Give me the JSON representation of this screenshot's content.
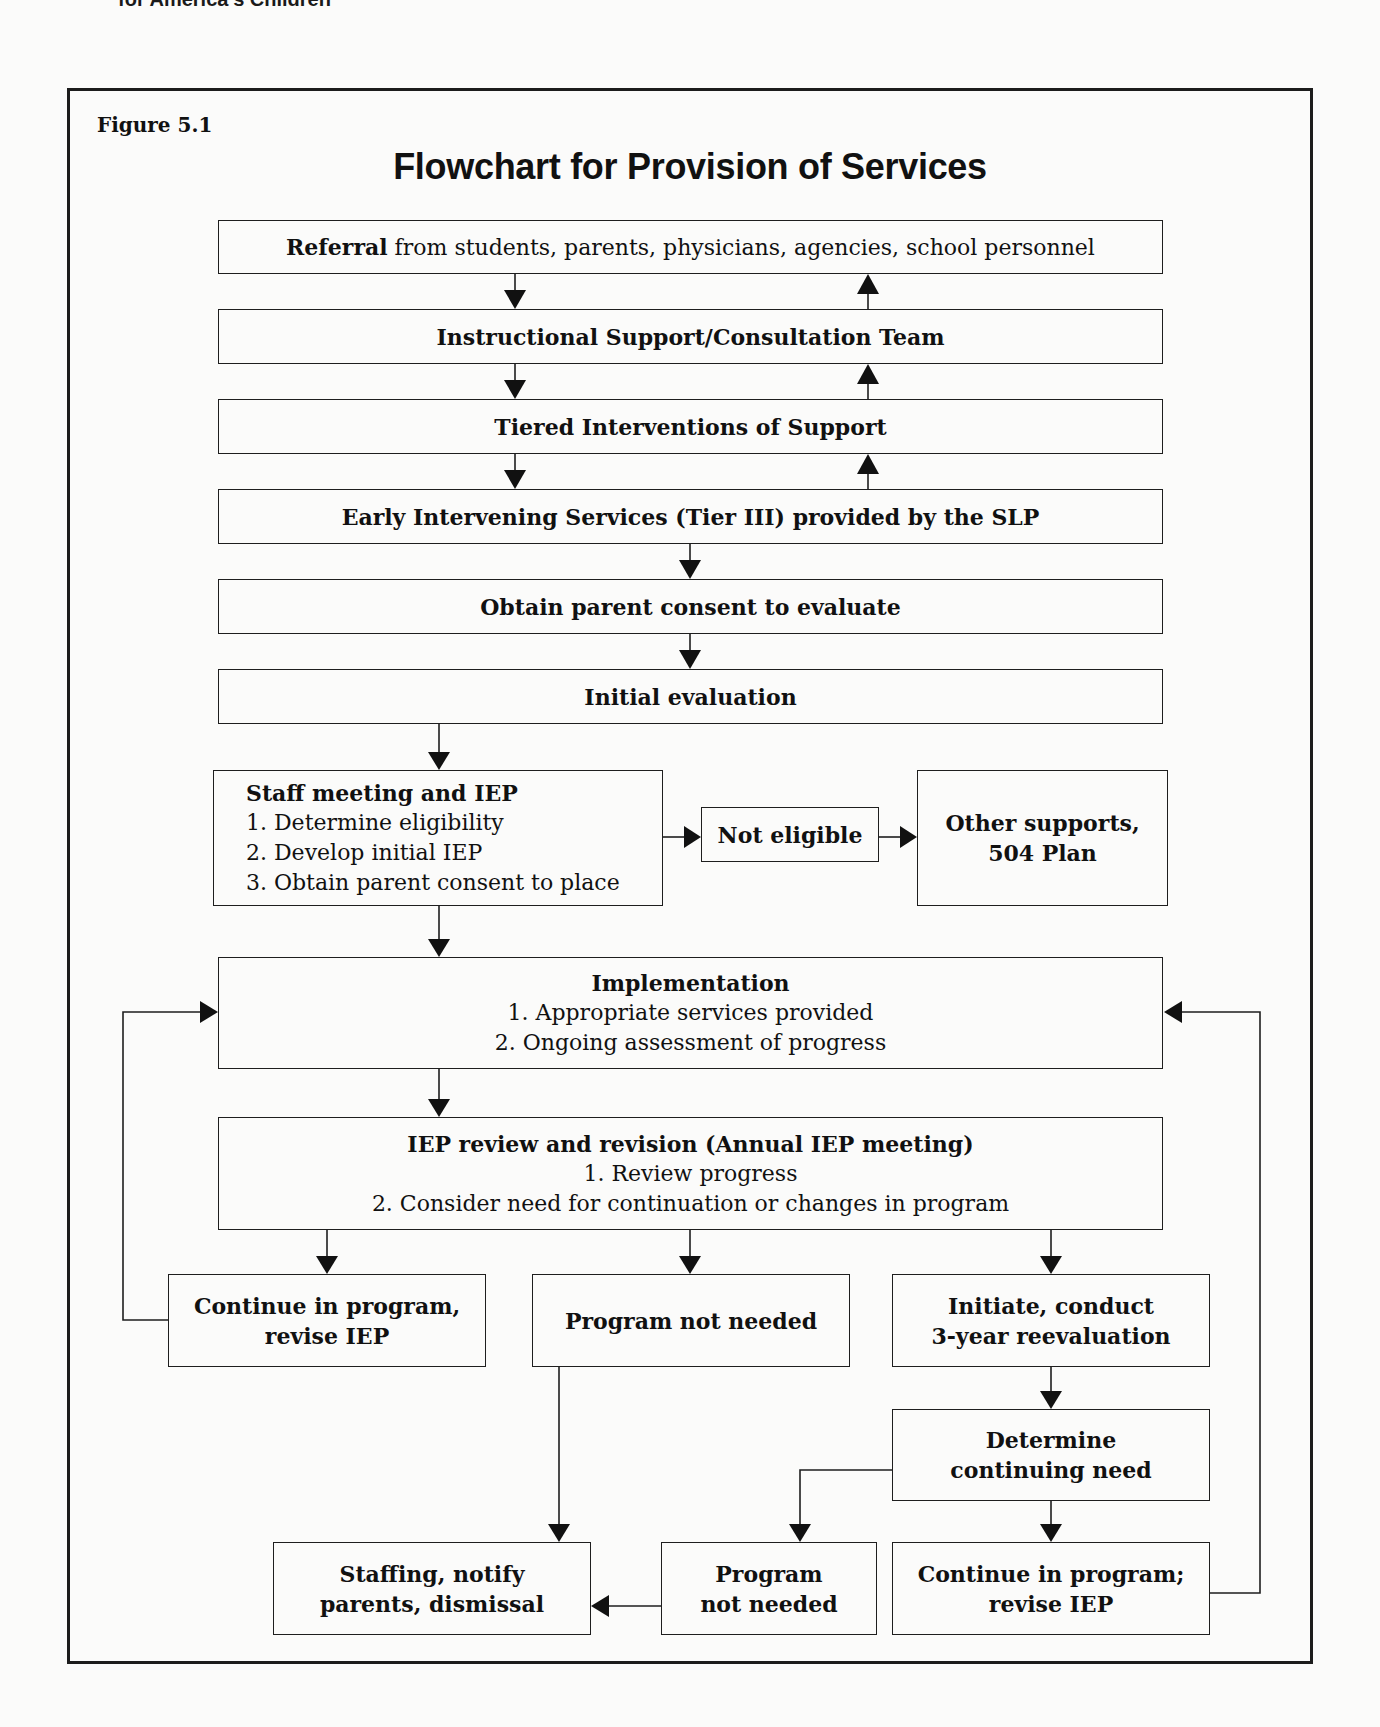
{
  "page": {
    "running_head": "for America's Children",
    "figure_label": "Figure 5.1",
    "title": "Flowchart for Provision of Services"
  },
  "nodes": {
    "referral": {
      "bold": "Referral",
      "text": " from students, parents, physicians, agencies, school personnel"
    },
    "instructional_support": {
      "title": "Instructional Support/Consultation Team"
    },
    "tiered_interventions": {
      "title": "Tiered Interventions of Support"
    },
    "early_intervening": {
      "title": "Early Intervening Services (Tier III) provided by the SLP"
    },
    "parent_consent": {
      "title": "Obtain parent consent to evaluate"
    },
    "initial_evaluation": {
      "title": "Initial evaluation"
    },
    "staff_meeting": {
      "title": "Staff meeting and IEP",
      "items": [
        "1. Determine eligibility",
        "2. Develop initial IEP",
        "3. Obtain parent consent to place"
      ]
    },
    "not_eligible": {
      "title": "Not eligible"
    },
    "other_supports": {
      "line1": "Other supports,",
      "line2": "504 Plan"
    },
    "implementation": {
      "title": "Implementation",
      "items": [
        "1. Appropriate services provided",
        "2. Ongoing assessment of progress"
      ]
    },
    "iep_review": {
      "title": "IEP review and revision (Annual IEP meeting)",
      "items": [
        "1. Review progress",
        "2. Consider need for continuation or changes in program"
      ]
    },
    "continue_revise": {
      "line1": "Continue in program,",
      "line2": "revise IEP"
    },
    "program_not_needed_1": {
      "title": "Program not needed"
    },
    "reevaluation": {
      "line1": "Initiate, conduct",
      "line2": "3-year reevaluation"
    },
    "determine_need": {
      "line1": "Determine",
      "line2": "continuing need"
    },
    "staffing_dismissal": {
      "line1": "Staffing, notify",
      "line2": "parents, dismissal"
    },
    "program_not_needed_2": {
      "line1": "Program",
      "line2": "not needed"
    },
    "continue_revise_2": {
      "line1": "Continue in program;",
      "line2": "revise IEP"
    }
  },
  "edges": [
    {
      "from": "referral",
      "to": "instructional_support",
      "direction": "down"
    },
    {
      "from": "instructional_support",
      "to": "referral",
      "direction": "up"
    },
    {
      "from": "instructional_support",
      "to": "tiered_interventions",
      "direction": "down"
    },
    {
      "from": "tiered_interventions",
      "to": "instructional_support",
      "direction": "up"
    },
    {
      "from": "tiered_interventions",
      "to": "early_intervening",
      "direction": "down"
    },
    {
      "from": "early_intervening",
      "to": "tiered_interventions",
      "direction": "up"
    },
    {
      "from": "early_intervening",
      "to": "parent_consent",
      "direction": "down"
    },
    {
      "from": "parent_consent",
      "to": "initial_evaluation",
      "direction": "down"
    },
    {
      "from": "initial_evaluation",
      "to": "staff_meeting",
      "direction": "down"
    },
    {
      "from": "staff_meeting",
      "to": "not_eligible",
      "direction": "right"
    },
    {
      "from": "not_eligible",
      "to": "other_supports",
      "direction": "right"
    },
    {
      "from": "staff_meeting",
      "to": "implementation",
      "direction": "down"
    },
    {
      "from": "implementation",
      "to": "iep_review",
      "direction": "down"
    },
    {
      "from": "iep_review",
      "to": "continue_revise",
      "direction": "down"
    },
    {
      "from": "iep_review",
      "to": "program_not_needed_1",
      "direction": "down"
    },
    {
      "from": "iep_review",
      "to": "reevaluation",
      "direction": "down"
    },
    {
      "from": "continue_revise",
      "to": "implementation",
      "direction": "loop-left"
    },
    {
      "from": "program_not_needed_1",
      "to": "staffing_dismissal",
      "direction": "down"
    },
    {
      "from": "reevaluation",
      "to": "determine_need",
      "direction": "down"
    },
    {
      "from": "determine_need",
      "to": "program_not_needed_2",
      "direction": "down-left"
    },
    {
      "from": "determine_need",
      "to": "continue_revise_2",
      "direction": "down"
    },
    {
      "from": "program_not_needed_2",
      "to": "staffing_dismissal",
      "direction": "left"
    },
    {
      "from": "continue_revise_2",
      "to": "implementation",
      "direction": "loop-right"
    }
  ]
}
